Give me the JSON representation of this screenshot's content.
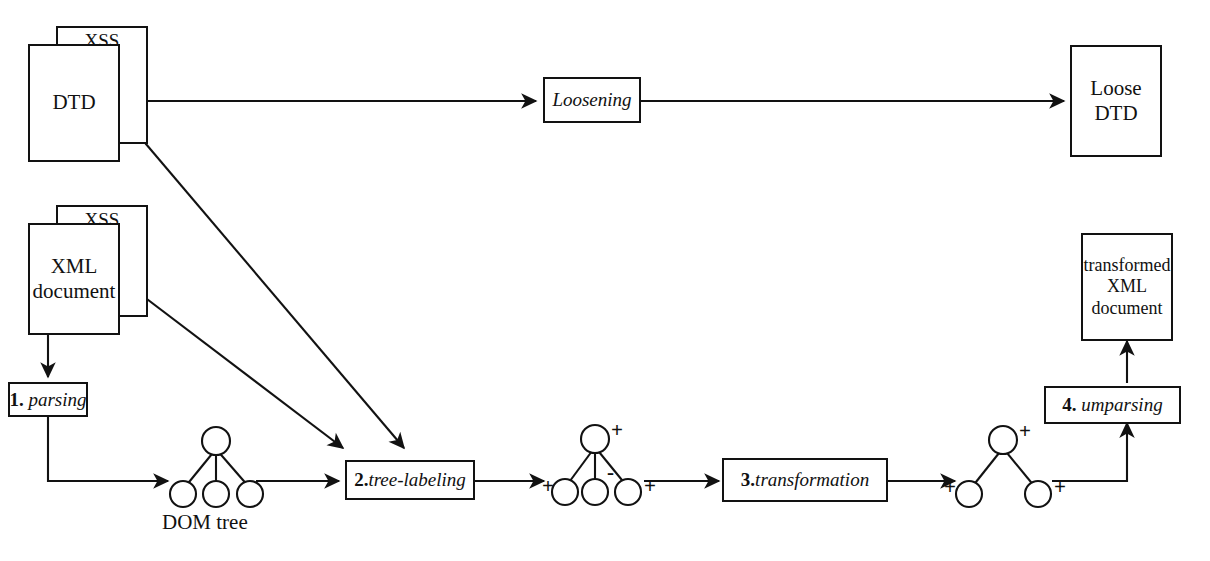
{
  "diagram": {
    "ink_color": "#121212",
    "background": "#ffffff"
  },
  "sources": {
    "dtd_stack": {
      "back_sheet_label": "XSS",
      "front_sheet_label": "DTD",
      "icon": "document-stack-icon"
    },
    "xml_stack": {
      "back_sheet_label": "XSS",
      "front_sheet_label": "XML\ndocument",
      "front_sheet_line1": "XML",
      "front_sheet_line2": "document",
      "icon": "document-stack-icon"
    }
  },
  "processes": [
    {
      "id": "loosening",
      "number": "",
      "name": "Loosening",
      "sep": ""
    },
    {
      "id": "parsing",
      "number": "1.",
      "name": "parsing",
      "sep": " "
    },
    {
      "id": "tree-labeling",
      "number": "2.",
      "name": "tree-labeling",
      "sep": ""
    },
    {
      "id": "transformation",
      "number": "3.",
      "name": "transformation",
      "sep": ""
    },
    {
      "id": "umparsing",
      "number": "4.",
      "name": "umparsing",
      "sep": " "
    }
  ],
  "outputs": {
    "loose_dtd": {
      "line1": "Loose",
      "line2": "DTD"
    },
    "transformed_xml": {
      "line1": "transformed",
      "line2": "XML",
      "line3": "document"
    }
  },
  "trees": {
    "dom_tree": {
      "caption": "DOM tree",
      "root_label": "",
      "children_labels": [
        "",
        "",
        ""
      ],
      "node_count": 4
    },
    "labeled_tree": {
      "caption": "",
      "root_label": "+",
      "children_labels": [
        "+",
        "-",
        "+"
      ],
      "node_count": 4
    },
    "transformed_tree": {
      "caption": "",
      "root_label": "+",
      "children_labels": [
        "+",
        "+"
      ],
      "node_count": 3
    }
  },
  "edges": [
    {
      "from": "dtd_stack",
      "to": "loosening",
      "style": "straight-horizontal"
    },
    {
      "from": "loosening",
      "to": "loose_dtd",
      "style": "straight-horizontal"
    },
    {
      "from": "dtd_stack",
      "to": "tree-labeling",
      "style": "diagonal"
    },
    {
      "from": "xml_stack",
      "to": "parsing",
      "style": "straight-vertical"
    },
    {
      "from": "xml_stack",
      "to": "tree-labeling",
      "style": "diagonal"
    },
    {
      "from": "parsing",
      "to": "dom_tree",
      "style": "elbow"
    },
    {
      "from": "dom_tree",
      "to": "tree-labeling",
      "style": "straight-horizontal"
    },
    {
      "from": "tree-labeling",
      "to": "labeled_tree",
      "style": "straight-horizontal"
    },
    {
      "from": "labeled_tree",
      "to": "transformation",
      "style": "straight-horizontal"
    },
    {
      "from": "transformation",
      "to": "transformed_tree",
      "style": "straight-horizontal"
    },
    {
      "from": "transformed_tree",
      "to": "umparsing",
      "style": "elbow"
    },
    {
      "from": "umparsing",
      "to": "transformed_xml",
      "style": "straight-vertical"
    }
  ]
}
